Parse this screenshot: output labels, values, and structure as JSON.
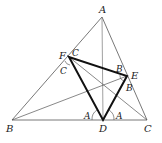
{
  "diagram": {
    "points": {
      "A": {
        "label": "A",
        "x": 102,
        "y": 17
      },
      "B": {
        "label": "B",
        "x": 12,
        "y": 120
      },
      "C": {
        "label": "C",
        "x": 147,
        "y": 120
      },
      "D": {
        "label": "D",
        "x": 103,
        "y": 120
      },
      "E": {
        "label": "E",
        "x": 127,
        "y": 76
      },
      "F": {
        "label": "F",
        "x": 69,
        "y": 57
      }
    },
    "angle_labels": {
      "F_upper": "C",
      "F_lower": "C",
      "E_upper": "B",
      "E_lower": "B",
      "D_left": "A",
      "D_right": "A"
    },
    "colors": {
      "thin_line": "#555555",
      "thick_line": "#111111",
      "text": "#222222"
    }
  }
}
